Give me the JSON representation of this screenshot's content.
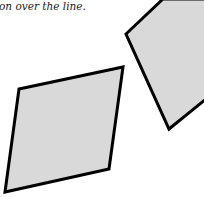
{
  "caption": "on over the line.",
  "figure": {
    "fill_color": "#d9d9d9",
    "stroke_color": "#000000",
    "shapes": [
      {
        "name": "left-parallelogram",
        "points": "19,89 123,67 109,169 5,192"
      },
      {
        "name": "right-quadrilateral",
        "points": "163,-1 126,34 169,129 206,99 206,-1"
      }
    ]
  }
}
